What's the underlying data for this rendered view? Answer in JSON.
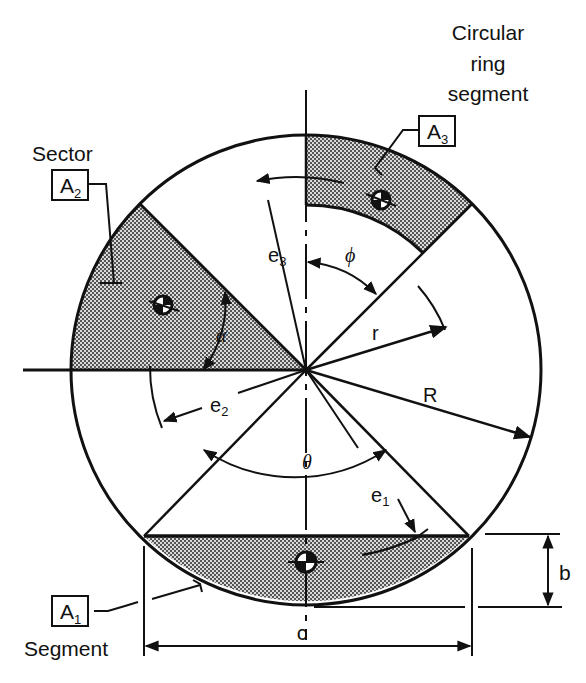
{
  "figure": {
    "colors": {
      "line": "#111111",
      "fill_pattern": "#8a8a8a",
      "background": "#ffffff"
    }
  },
  "labels": {
    "ring_title_line1": "Circular",
    "ring_title_line2": "ring",
    "ring_title_line3": "segment",
    "ring_area": "A",
    "ring_area_sub": "3",
    "sector_title": "Sector",
    "sector_area": "A",
    "sector_area_sub": "2",
    "segment_title": "Segment",
    "segment_area": "A",
    "segment_area_sub": "1"
  },
  "dimensions": {
    "e1": "e",
    "e1_sub": "1",
    "e2": "e",
    "e2_sub": "2",
    "e3": "e",
    "e3_sub": "3",
    "phi": "ϕ",
    "alpha": "α",
    "theta": "θ",
    "r": "r",
    "R": "R",
    "b": "b",
    "c": "c"
  }
}
